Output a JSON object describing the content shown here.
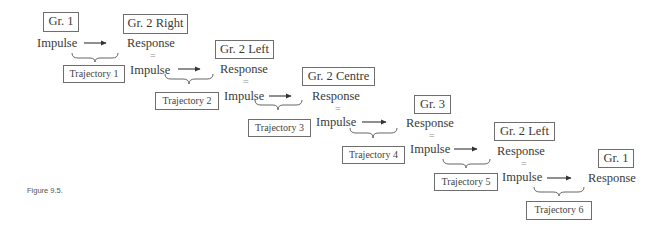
{
  "figure": {
    "caption": "Figure 9.5.",
    "stages": [
      {
        "group": "Gr. 1",
        "response": null,
        "equals": null,
        "impulse": "Impulse"
      },
      {
        "group": "Gr. 2 Right",
        "response": "Response",
        "equals": "=",
        "impulse": "Impulse"
      },
      {
        "group": "Gr. 2 Left",
        "response": "Response",
        "equals": "=",
        "impulse": "Impulse"
      },
      {
        "group": "Gr. 2 Centre",
        "response": "Response",
        "equals": "=",
        "impulse": "Impulse"
      },
      {
        "group": "Gr. 3",
        "response": "Response",
        "equals": "=",
        "impulse": "Impulse"
      },
      {
        "group": "Gr. 2 Left",
        "response": "Response",
        "equals": "=",
        "impulse": "Impulse"
      },
      {
        "group": "Gr. 1",
        "response": "Response",
        "equals": null,
        "impulse": null
      }
    ],
    "trajectories": [
      {
        "label": "Trajectory 1"
      },
      {
        "label": "Trajectory 2"
      },
      {
        "label": "Trajectory 3"
      },
      {
        "label": "Trajectory 4"
      },
      {
        "label": "Trajectory 5"
      },
      {
        "label": "Trajectory 6"
      }
    ],
    "colors": {
      "text": "#3a3a3a",
      "border": "#6e6e6e",
      "arrow": "#333333"
    }
  }
}
